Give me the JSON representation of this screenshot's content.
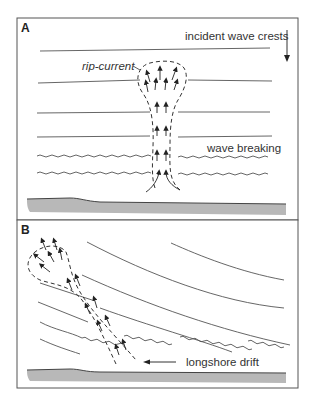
{
  "figure": {
    "panels": [
      {
        "id": "A",
        "letter": "A",
        "labels": {
          "incident": "incident wave crests",
          "rip": "rip-current",
          "breaking": "wave breaking"
        }
      },
      {
        "id": "B",
        "letter": "B",
        "labels": {
          "longshore": "longshore drift"
        }
      }
    ],
    "colors": {
      "frame": "#555555",
      "line": "#555555",
      "shore": "#b8b8b8",
      "text": "#333333"
    }
  }
}
